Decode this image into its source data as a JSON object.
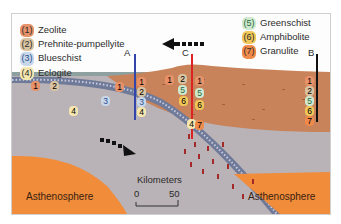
{
  "legend": {
    "items": [
      {
        "num": "(1)",
        "label": "Zeolite",
        "color": "#e8926a"
      },
      {
        "num": "(2)",
        "label": "Prehnite-pumpellyite",
        "color": "#d9c3a0"
      },
      {
        "num": "(3)",
        "label": "Blueschist",
        "color": "#9bb8d8"
      },
      {
        "num": "(4)",
        "label": "Eclogite",
        "color": "#f2dc8c"
      },
      {
        "num": "(5)",
        "label": "Greenschist",
        "color": "#9ccf9c"
      },
      {
        "num": "(6)",
        "label": "Amphibolite",
        "color": "#f2c75a"
      },
      {
        "num": "(7)",
        "label": "Granulite",
        "color": "#f08a4a"
      }
    ]
  },
  "sections": {
    "a": {
      "label": "A",
      "sequence": [
        "1",
        "2",
        "3",
        "4"
      ],
      "color": "#3344aa"
    },
    "b": {
      "label": "B",
      "sequence": [
        "1",
        "2",
        "5",
        "6",
        "7"
      ],
      "color": "#111111"
    },
    "c": {
      "label": "C",
      "sequence": [
        "1",
        "5",
        "6",
        "7"
      ],
      "color": "#dd2222"
    }
  },
  "regions": {
    "asthenosphere_left": "Asthenosphere",
    "asthenosphere_right": "Asthenosphere"
  },
  "scale": {
    "title": "Kilometers",
    "start": "0",
    "end": "50"
  },
  "arrows": {
    "plate_motion": "arrow-left",
    "subduction": "arrow-down-right"
  },
  "badges": {
    "b1": "1",
    "b2": "2",
    "b3": "3",
    "b4": "4",
    "b5": "5",
    "b6": "6",
    "b7": "7"
  },
  "colors": {
    "mantle": "#b9b2b6",
    "continental_crust": "#c9835a",
    "asthenosphere": "#f08c3a",
    "slab": "#6f7a99",
    "ocean": "#8fa0a0"
  }
}
